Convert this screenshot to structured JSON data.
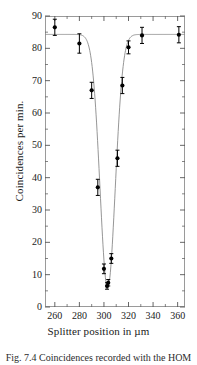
{
  "figure": {
    "caption": "Fig. 7.4 Coincidences recorded with the HOM"
  },
  "chart_data": {
    "type": "scatter",
    "title": "",
    "xlabel": "Splitter position in  µm",
    "ylabel": "Coincidences per min.",
    "xlim": [
      252,
      366
    ],
    "ylim": [
      0,
      90
    ],
    "grid": false,
    "legend": null,
    "xticks": [
      260,
      280,
      300,
      320,
      340,
      360
    ],
    "xtick_labels": [
      "260",
      "280",
      "300",
      "320",
      "340",
      "360"
    ],
    "xminor_step": 10,
    "yticks": [
      0,
      10,
      20,
      30,
      40,
      50,
      60,
      70,
      80,
      90
    ],
    "ytick_labels": [
      "0",
      "10",
      "20",
      "30",
      "40",
      "50",
      "60",
      "70",
      "80",
      "90"
    ],
    "yminor_step": 5,
    "marker": "filled-circle",
    "marker_color": "#000000",
    "errorbar_color": "#000000",
    "fit_curve_color": "#8a8a8a",
    "x": [
      260,
      280,
      290,
      295,
      300,
      302.5,
      303.5,
      306,
      311,
      315,
      320,
      331,
      361
    ],
    "y": [
      86.5,
      81.5,
      67.0,
      37.0,
      11.8,
      6.5,
      7.5,
      15.0,
      46.0,
      68.5,
      80.3,
      84.0,
      84.2
    ],
    "yerr": [
      2.5,
      3.0,
      2.5,
      2.5,
      1.5,
      1.0,
      1.0,
      1.5,
      2.5,
      2.5,
      2.0,
      2.5,
      2.5
    ],
    "fit": {
      "model": "gaussian-dip",
      "baseline": 84.3,
      "depth": 78.5,
      "center": 303.0,
      "sigma": 6.2
    }
  }
}
